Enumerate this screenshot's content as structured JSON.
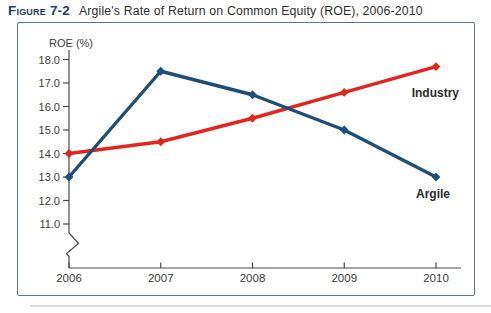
{
  "figure": {
    "label": "Figure 7-2",
    "caption": "Argile's Rate of Return on Common Equity (ROE), 2006-2010"
  },
  "chart_data": {
    "type": "line",
    "title": "Argile's Rate of Return on Common Equity (ROE), 2006-2010",
    "ylabel": "ROE (%)",
    "xlabel": "",
    "categories": [
      "2006",
      "2007",
      "2008",
      "2009",
      "2010"
    ],
    "yticks": [
      18.0,
      17.0,
      16.0,
      15.0,
      14.0,
      13.0,
      12.0,
      11.0
    ],
    "ylim": [
      11.0,
      18.0
    ],
    "axis_break": true,
    "grid": false,
    "legend_position": "inline-labels",
    "series": [
      {
        "name": "Argile",
        "color": "#1b4e79",
        "values": [
          13.0,
          17.5,
          16.5,
          15.0,
          13.0
        ]
      },
      {
        "name": "Industry",
        "color": "#e3261d",
        "values": [
          14.0,
          14.5,
          15.5,
          16.6,
          17.7
        ]
      }
    ]
  },
  "colors": {
    "box_border": "#5e6caa",
    "figure_label": "#1f3b6e",
    "axis": "#4a4a4a"
  }
}
